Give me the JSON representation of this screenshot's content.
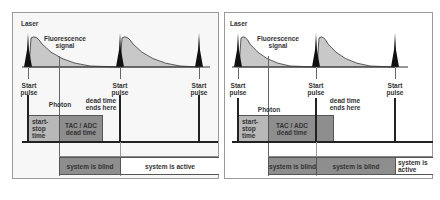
{
  "left_panel": {
    "laser_label": "Laser",
    "fluorescence_label": "Fluorescence\nsignal",
    "start_pulse_labels": [
      "Start\npulse",
      "Start\npulse",
      "Start\npulse"
    ],
    "photon_label": "Photon",
    "dead_time_label": "dead time\nends here",
    "start_stop_box": "start-\nstop\ntime",
    "tac_adc_box": "TAC / ADC\ndead time",
    "blind_box": "system is blind",
    "active_box": "system is active"
  },
  "right_panel": {
    "laser_label": "Laser",
    "fluorescence_label": "Fluorescence\nsignal",
    "start_pulse_labels": [
      "Start\npulse",
      "Start\npulse",
      "Start\npulse"
    ],
    "photon_label": "Photon",
    "dead_time_label": "dead time\nends here",
    "start_stop_box": "start-\nstop\ntime",
    "tac_adc_box": "TAC / ADC\ndead time",
    "blind_box_1": "system is blind",
    "blind_box_2": "system is blind",
    "active_box": "system is\nactive"
  },
  "colors": {
    "light_gray": "#b8b8b8",
    "dark_gray": "#8e8e8e",
    "pulse_black": "#111111",
    "fluorescence_fill": "#c8c8c8"
  }
}
